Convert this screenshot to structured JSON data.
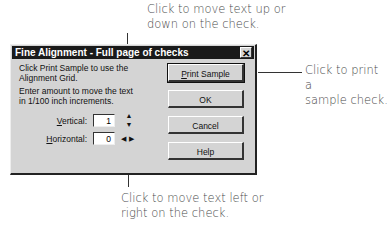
{
  "callouts": {
    "top": [
      "Click to move text up or",
      "down on the check."
    ],
    "right": [
      "Click to print a",
      "sample check."
    ],
    "bottom": [
      "Click to move text left or",
      "right on the check."
    ]
  },
  "dialog": {
    "title": "Fine Alignment - Full page of checks",
    "close_glyph": "✕",
    "instruction1": "Click Print Sample to use the Alignment Grid.",
    "instruction2": "Enter amount to move the text in 1/100 inch increments.",
    "vertical_label_accel": "V",
    "vertical_label_rest": "ertical:",
    "vertical_value": "1",
    "horizontal_label_accel": "H",
    "horizontal_label_rest": "orizontal:",
    "horizontal_value": "0",
    "up_arrow": "▲",
    "down_arrow": "▼",
    "left_arrow": "◀",
    "right_arrow": "▶",
    "buttons": {
      "print_sample_accel": "P",
      "print_sample_rest": "rint Sample",
      "ok": "OK",
      "cancel": "Cancel",
      "help": "Help"
    }
  }
}
